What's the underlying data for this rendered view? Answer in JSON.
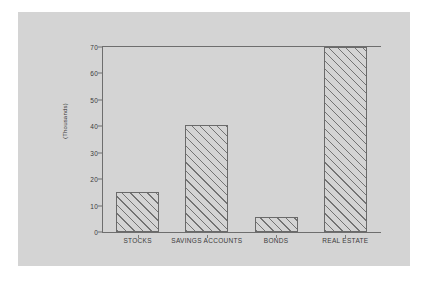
{
  "chart_data": {
    "type": "bar",
    "title": "",
    "subtitle": "",
    "xlabel": "",
    "ylabel": "(Thousands)",
    "categories": [
      "STOCKS",
      "SAVINGS ACCOUNTS",
      "BONDS",
      "REAL ESTATE"
    ],
    "values": [
      15,
      40.5,
      5.5,
      70
    ],
    "ylim": [
      0,
      70
    ],
    "yticks": [
      0,
      10,
      20,
      30,
      40,
      50,
      60,
      70
    ],
    "ytick_labels": [
      "0",
      "10",
      "20",
      "30",
      "40",
      "50",
      "60",
      "70"
    ],
    "grid": false,
    "legend": null,
    "legend_position": "none",
    "bar_fill": "diagonal-hatch",
    "colors": {
      "panel_background": "#d4d4d4",
      "page_background": "#ffffff",
      "axis_line": "#6e6e6e",
      "bar_outline": "#6a6a6a",
      "hatch_line": "#6e6e6e",
      "tick_label": "#3a3a3a"
    }
  },
  "axis": {
    "y_title": "(Thousands)"
  }
}
